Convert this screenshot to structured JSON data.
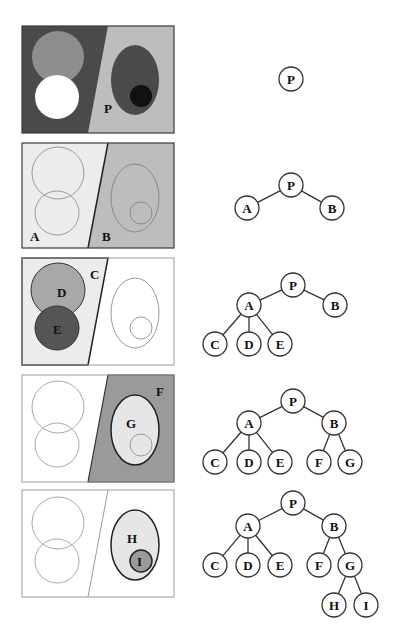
{
  "figure": {
    "colors": {
      "frame_stroke": "#3a3a3a",
      "outline_light": "#9a9a9a",
      "dark_region": "#4a4a4a",
      "mid_gray": "#8e8e8e",
      "light_gray": "#bdbdbd",
      "very_light": "#ececec",
      "white": "#ffffff",
      "black": "#111111",
      "node_fill": "#ffffff",
      "node_stroke": "#333333"
    }
  },
  "panels": [
    {
      "id": "panel-1",
      "labels": [
        {
          "text": "P",
          "x": 104,
          "y": 113
        }
      ]
    },
    {
      "id": "panel-2",
      "labels": [
        {
          "text": "A",
          "x": 34,
          "y": 241
        },
        {
          "text": "B",
          "x": 106,
          "y": 241
        }
      ]
    },
    {
      "id": "panel-3",
      "labels": [
        {
          "text": "C",
          "x": 94,
          "y": 274
        },
        {
          "text": "D",
          "x": 61,
          "y": 295
        },
        {
          "text": "E",
          "x": 57,
          "y": 338
        }
      ]
    },
    {
      "id": "panel-4",
      "labels": [
        {
          "text": "F",
          "x": 160,
          "y": 392
        },
        {
          "text": "G",
          "x": 131,
          "y": 424
        }
      ]
    },
    {
      "id": "panel-5",
      "labels": [
        {
          "text": "H",
          "x": 131,
          "y": 541
        },
        {
          "text": "I",
          "x": 140,
          "y": 564
        }
      ]
    }
  ],
  "trees": [
    {
      "id": "tree-1",
      "nodes": [
        {
          "label": "P",
          "x": 291,
          "y": 79
        }
      ],
      "edges": []
    },
    {
      "id": "tree-2",
      "nodes": [
        {
          "label": "P",
          "x": 291,
          "y": 185
        },
        {
          "label": "A",
          "x": 247,
          "y": 208
        },
        {
          "label": "B",
          "x": 332,
          "y": 208
        }
      ],
      "edges": [
        [
          0,
          1
        ],
        [
          0,
          2
        ]
      ]
    },
    {
      "id": "tree-3",
      "nodes": [
        {
          "label": "P",
          "x": 293,
          "y": 285
        },
        {
          "label": "A",
          "x": 249,
          "y": 305
        },
        {
          "label": "B",
          "x": 335,
          "y": 305
        },
        {
          "label": "C",
          "x": 215,
          "y": 344
        },
        {
          "label": "D",
          "x": 249,
          "y": 344
        },
        {
          "label": "E",
          "x": 280,
          "y": 344
        }
      ],
      "edges": [
        [
          0,
          1
        ],
        [
          0,
          2
        ],
        [
          1,
          3
        ],
        [
          1,
          4
        ],
        [
          1,
          5
        ]
      ]
    },
    {
      "id": "tree-4",
      "nodes": [
        {
          "label": "P",
          "x": 293,
          "y": 401
        },
        {
          "label": "A",
          "x": 249,
          "y": 423
        },
        {
          "label": "B",
          "x": 334,
          "y": 423
        },
        {
          "label": "C",
          "x": 215,
          "y": 462
        },
        {
          "label": "D",
          "x": 249,
          "y": 462
        },
        {
          "label": "E",
          "x": 280,
          "y": 462
        },
        {
          "label": "F",
          "x": 319,
          "y": 462
        },
        {
          "label": "G",
          "x": 350,
          "y": 462
        }
      ],
      "edges": [
        [
          0,
          1
        ],
        [
          0,
          2
        ],
        [
          1,
          3
        ],
        [
          1,
          4
        ],
        [
          1,
          5
        ],
        [
          2,
          6
        ],
        [
          2,
          7
        ]
      ]
    },
    {
      "id": "tree-5",
      "nodes": [
        {
          "label": "P",
          "x": 293,
          "y": 503
        },
        {
          "label": "A",
          "x": 248,
          "y": 526
        },
        {
          "label": "B",
          "x": 334,
          "y": 526
        },
        {
          "label": "C",
          "x": 215,
          "y": 565
        },
        {
          "label": "D",
          "x": 248,
          "y": 565
        },
        {
          "label": "E",
          "x": 280,
          "y": 565
        },
        {
          "label": "F",
          "x": 319,
          "y": 565
        },
        {
          "label": "G",
          "x": 350,
          "y": 565
        },
        {
          "label": "H",
          "x": 334,
          "y": 605
        },
        {
          "label": "I",
          "x": 366,
          "y": 605
        }
      ],
      "edges": [
        [
          0,
          1
        ],
        [
          0,
          2
        ],
        [
          1,
          3
        ],
        [
          1,
          4
        ],
        [
          1,
          5
        ],
        [
          2,
          6
        ],
        [
          2,
          7
        ],
        [
          7,
          8
        ],
        [
          7,
          9
        ]
      ]
    }
  ]
}
